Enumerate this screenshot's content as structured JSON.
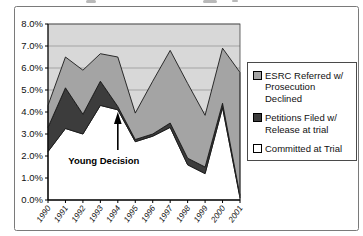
{
  "chart_data": {
    "type": "area",
    "stacked": true,
    "title": "",
    "xlabel": "",
    "ylabel": "",
    "x": [
      "1990",
      "1991",
      "1992",
      "1993",
      "1994",
      "1995",
      "1996",
      "1997",
      "1998",
      "1999",
      "2000",
      "2001"
    ],
    "series": [
      {
        "name": "Committed at Trial",
        "color": "#ffffff",
        "values": [
          2.2,
          3.25,
          3.0,
          4.3,
          4.1,
          2.65,
          2.9,
          3.3,
          1.6,
          1.2,
          4.2,
          0.1
        ]
      },
      {
        "name": "Petitions Filed w/ Release at trial",
        "color": "#3c3c3c",
        "values": [
          1.1,
          1.85,
          0.9,
          1.1,
          0.15,
          0.1,
          0.1,
          0.2,
          0.3,
          0.3,
          0.2,
          0.1
        ]
      },
      {
        "name": "ESRC Referred w/ Prosecution Declined",
        "color": "#a4a4a4",
        "values": [
          1.0,
          1.4,
          2.0,
          1.25,
          2.25,
          1.2,
          2.4,
          3.3,
          3.4,
          2.35,
          2.5,
          5.6
        ]
      }
    ],
    "ylim": [
      0,
      8
    ],
    "ytick_step": 1.0,
    "yticks": [
      "0.0%",
      "1.0%",
      "2.0%",
      "3.0%",
      "4.0%",
      "5.0%",
      "6.0%",
      "7.0%",
      "8.0%"
    ],
    "grid": true,
    "plot_bg": "#d8d8d8",
    "gridline_color": "#909090",
    "legend_position": "right",
    "annotation": {
      "text": "Young Decision",
      "arrow_points_to_year": "1994"
    }
  },
  "legend": {
    "items": [
      {
        "lines": [
          "ESRC Referred w/",
          "Prosecution Declined"
        ],
        "swatch": "#a4a4a4"
      },
      {
        "lines": [
          "Petitions Filed w/",
          "Release at trial"
        ],
        "swatch": "#3c3c3c"
      },
      {
        "lines": [
          "Committed at Trial"
        ],
        "swatch": "#ffffff"
      }
    ]
  }
}
